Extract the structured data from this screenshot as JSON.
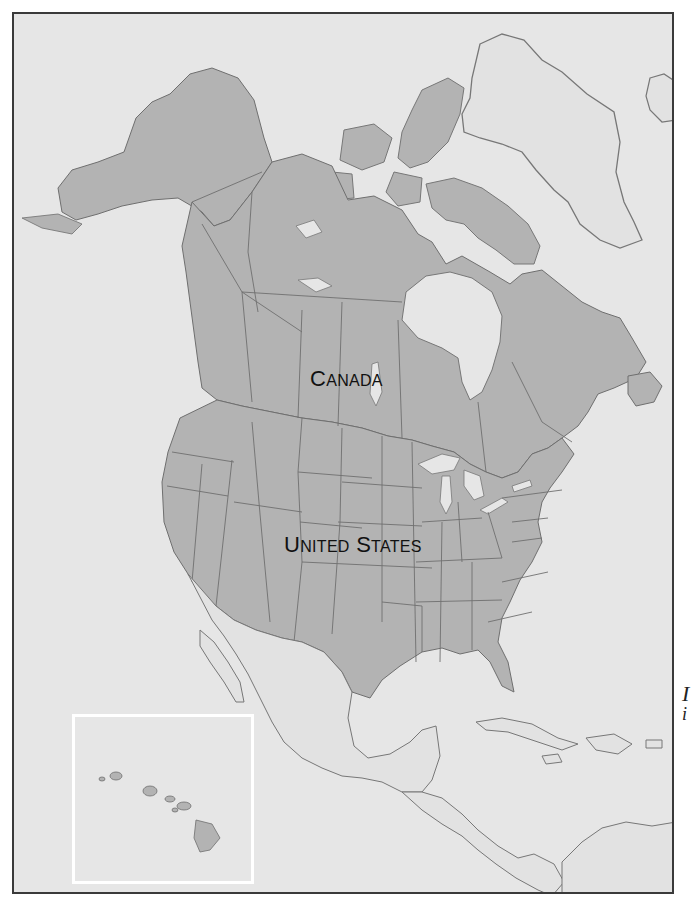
{
  "map": {
    "title": "",
    "labels": {
      "canada": {
        "first": "C",
        "rest": "ANADA"
      },
      "united_states": {
        "w1_first": "U",
        "w1_rest": "NITED",
        "w2_first": "S",
        "w2_rest": "TATES"
      }
    },
    "inset": {
      "region": "Hawaii"
    },
    "edge_text": {
      "line1": "I",
      "line2": "i"
    },
    "colors": {
      "ocean": "#e6e6e6",
      "highlighted_land": "#b3b3b3",
      "other_land": "#e2e2e2",
      "borders": "#6f6f6f",
      "frame": "#3a3a3a",
      "inset_border": "#ffffff",
      "label": "#111111"
    }
  }
}
